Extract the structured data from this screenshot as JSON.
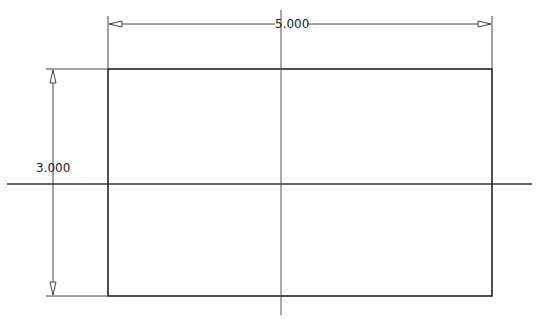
{
  "drawing": {
    "width_dimension": {
      "label": "5.000",
      "value": 5.0
    },
    "height_dimension": {
      "label": "3.000",
      "value": 3.0
    },
    "rectangle": {
      "x": 108,
      "y": 69,
      "w": 384,
      "h": 227
    },
    "centerlines": {
      "horizontal": {
        "y": 184,
        "x1": 7,
        "x2": 532
      },
      "vertical": {
        "x": 281,
        "y1": 10,
        "y2": 315
      }
    },
    "colors": {
      "line": "#222222",
      "thin": "#444444",
      "background": "#ffffff"
    }
  }
}
